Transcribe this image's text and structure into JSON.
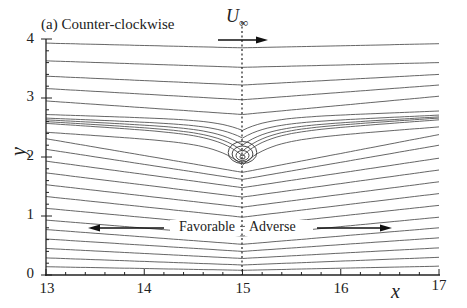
{
  "figure": {
    "panel_title": "(a) Counter-clockwise",
    "freestream_label": "U",
    "freestream_subscript": "∞",
    "x_axis_title": "x",
    "y_axis_title": "y",
    "x_ticks": [
      "13",
      "14",
      "15",
      "16",
      "17"
    ],
    "y_ticks": [
      "0",
      "1",
      "2",
      "3",
      "4"
    ],
    "region_left": "Favorable",
    "region_right": "Adverse",
    "line_color": "#555555",
    "axis_color": "#222222"
  },
  "chart_data": {
    "type": "line",
    "title": "(a) Counter-clockwise",
    "xlabel": "x",
    "ylabel": "y",
    "xlim": [
      13,
      17
    ],
    "ylim": [
      0,
      4
    ],
    "x_ticks": [
      13,
      14,
      15,
      16,
      17
    ],
    "y_ticks": [
      0,
      1,
      2,
      3,
      4
    ],
    "grid": false,
    "annotations": [
      {
        "text": "U∞",
        "x": 15,
        "y": 4.1,
        "arrow": "right"
      },
      {
        "text": "Favorable",
        "x": 14.5,
        "y": 1.08,
        "arrow": "left"
      },
      {
        "text": "Adverse",
        "x": 15.5,
        "y": 1.08,
        "arrow": "right"
      },
      {
        "type": "vertical-dashed-line",
        "x": 15
      }
    ],
    "streamline_start_y_at_x13": [
      3.93,
      3.63,
      3.37,
      3.16,
      2.95,
      2.72,
      2.66,
      2.63,
      2.6,
      2.57,
      2.42,
      2.31,
      2.13,
      1.93,
      1.73,
      1.53,
      1.33,
      1.13,
      0.93,
      0.77,
      0.61,
      0.45,
      0.29,
      0.14
    ],
    "streamline_min_y_at_x15": [
      3.85,
      3.52,
      3.22,
      2.97,
      2.72,
      2.45,
      2.32,
      2.2,
      2.1,
      2.02,
      1.86,
      1.74,
      1.62,
      1.48,
      1.32,
      1.15,
      0.98,
      0.82,
      0.66,
      0.52,
      0.4,
      0.28,
      0.17,
      0.08
    ],
    "streamline_end_y_at_x17": [
      3.92,
      3.6,
      3.4,
      3.22,
      3.03,
      2.78,
      2.71,
      2.68,
      2.66,
      2.63,
      2.51,
      2.38,
      2.2,
      1.98,
      1.78,
      1.58,
      1.38,
      1.18,
      0.98,
      0.8,
      0.63,
      0.46,
      0.3,
      0.15
    ],
    "closed_loops_center": [
      15.0,
      2.0
    ],
    "closed_loops_count": 4
  }
}
